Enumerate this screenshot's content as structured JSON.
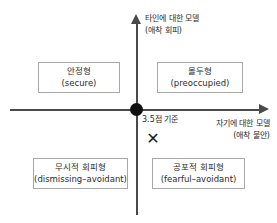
{
  "diagram": {
    "axes": {
      "vertical": {
        "line1": "타인에 대한 모델",
        "line2": "(애착 회피)"
      },
      "horizontal": {
        "line1": "자기에 대한 모델",
        "line2": "(애착 불안)"
      }
    },
    "origin": {
      "cutoff_label": "3.5점 기준",
      "marker_glyph": "✕"
    },
    "quadrants": [
      {
        "id": "secure",
        "ko": "안정형",
        "en": "(secure)"
      },
      {
        "id": "preoccupied",
        "ko": "몰두형",
        "en": "(preoccupied)"
      },
      {
        "id": "dismissing",
        "ko": "무시적 회피형",
        "en": "(dismissing–avoidant)"
      },
      {
        "id": "fearful",
        "ko": "공포적 회피형",
        "en": "(fearful–avoidant)"
      }
    ],
    "colors": {
      "axis": "#4a4a4a",
      "box_border": "#a8a8a8",
      "text": "#2b2b2b",
      "origin_dot": "#111111",
      "background": "#ffffff"
    }
  }
}
